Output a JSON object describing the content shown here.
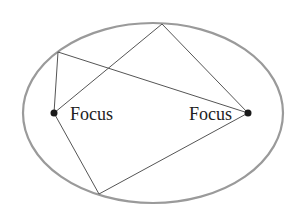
{
  "diagram": {
    "type": "ellipse-reflection",
    "ellipse": {
      "cx": 153,
      "cy": 113,
      "rx": 130,
      "ry": 90,
      "stroke": "#9a9a9a",
      "stroke_width": 2.2
    },
    "foci": [
      {
        "id": "left",
        "x": 54,
        "y": 113,
        "label": "Focus",
        "label_x": 70,
        "label_y": 120,
        "anchor": "start"
      },
      {
        "id": "right",
        "x": 248,
        "y": 113,
        "label": "Focus",
        "label_x": 232,
        "label_y": 120,
        "anchor": "end"
      }
    ],
    "focus_color": "#1a1a1a",
    "focus_radius": 3.5,
    "line_color": "#555555",
    "line_width": 1,
    "boundary_points": {
      "top": {
        "x": 162,
        "y": 24
      },
      "upper_left": {
        "x": 58,
        "y": 52
      },
      "bottom": {
        "x": 99,
        "y": 194
      }
    },
    "segments": [
      {
        "from": "left_focus",
        "to": "top",
        "x1": 54,
        "y1": 113,
        "x2": 162,
        "y2": 24
      },
      {
        "from": "top",
        "to": "right_focus",
        "x1": 162,
        "y1": 24,
        "x2": 248,
        "y2": 113
      },
      {
        "from": "left_focus",
        "to": "upper_left",
        "x1": 54,
        "y1": 113,
        "x2": 58,
        "y2": 52
      },
      {
        "from": "upper_left",
        "to": "right_focus",
        "x1": 58,
        "y1": 52,
        "x2": 248,
        "y2": 113
      },
      {
        "from": "left_focus",
        "to": "bottom",
        "x1": 54,
        "y1": 113,
        "x2": 99,
        "y2": 194
      },
      {
        "from": "bottom",
        "to": "right_focus",
        "x1": 99,
        "y1": 194,
        "x2": 248,
        "y2": 113
      }
    ],
    "labels": {
      "left_focus": "Focus",
      "right_focus": "Focus"
    }
  }
}
